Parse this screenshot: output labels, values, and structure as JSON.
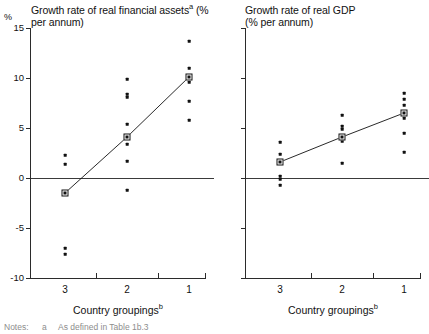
{
  "figure": {
    "y_axis_unit": "%",
    "notes_prefix": "Notes:",
    "note_marker": "a",
    "note_text": "As defined in Table 1b.3"
  },
  "panels": [
    {
      "id": "financial-assets",
      "title": "Growth rate of real financial assets",
      "title_sup": "a",
      "title_line2": "(% per annum)",
      "xlabel": "Country groupings",
      "xlabel_sup": "b"
    },
    {
      "id": "real-gdp",
      "title": "Growth rate of real GDP",
      "title_sup": "",
      "title_line2": "(% per annum)",
      "xlabel": "Country groupings",
      "xlabel_sup": "b"
    }
  ],
  "chart_data": [
    {
      "type": "scatter",
      "id": "financial-assets",
      "title": "Growth rate of real financial assets (% per annum)",
      "xlabel": "Country groupings",
      "ylabel": "%",
      "ylim": [
        -10,
        15
      ],
      "yticks": [
        15,
        10,
        5,
        0,
        -5,
        -10
      ],
      "categories": [
        "3",
        "2",
        "1"
      ],
      "xtick_labels": [
        "3",
        "2",
        "1"
      ],
      "grid": false,
      "legend": "none",
      "zero_line": 0,
      "series": [
        {
          "name": "Group 3",
          "category": "3",
          "values": [
            2.3,
            1.4,
            -1.5,
            -7.0,
            -7.6
          ],
          "mean": -1.5
        },
        {
          "name": "Group 2",
          "category": "2",
          "values": [
            9.9,
            8.4,
            8.1,
            5.4,
            4.1,
            3.4,
            1.7,
            -1.2
          ],
          "mean": 4.1
        },
        {
          "name": "Group 1",
          "category": "1",
          "values": [
            13.7,
            11.0,
            10.1,
            9.6,
            7.7,
            5.8
          ],
          "mean": 10.1
        }
      ],
      "trend_line": {
        "x": [
          "3",
          "2",
          "1"
        ],
        "y": [
          -1.5,
          4.1,
          10.1
        ]
      }
    },
    {
      "type": "scatter",
      "id": "real-gdp",
      "title": "Growth rate of real GDP (% per annum)",
      "xlabel": "Country groupings",
      "ylabel": "%",
      "ylim": [
        -10,
        15
      ],
      "yticks": [
        15,
        10,
        5,
        0,
        -5,
        -10
      ],
      "categories": [
        "3",
        "2",
        "1"
      ],
      "xtick_labels": [
        "3",
        "2",
        "1"
      ],
      "grid": false,
      "legend": "none",
      "zero_line": 0,
      "series": [
        {
          "name": "Group 3",
          "category": "3",
          "values": [
            3.6,
            2.4,
            1.6,
            0.2,
            -0.1,
            -0.7
          ],
          "mean": 1.6
        },
        {
          "name": "Group 2",
          "category": "2",
          "values": [
            6.3,
            5.2,
            4.9,
            4.1,
            3.7,
            1.5
          ],
          "mean": 4.1
        },
        {
          "name": "Group 1",
          "category": "1",
          "values": [
            8.5,
            7.9,
            7.3,
            6.5,
            6.0,
            4.5,
            2.6
          ],
          "mean": 6.5
        }
      ],
      "trend_line": {
        "x": [
          "3",
          "2",
          "1"
        ],
        "y": [
          1.6,
          4.1,
          6.5
        ]
      }
    }
  ]
}
